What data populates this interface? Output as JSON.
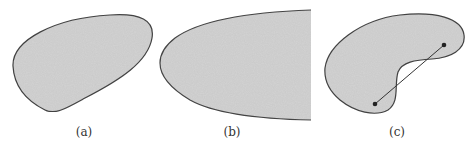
{
  "figure": {
    "fill_color": "#d3d3d3",
    "stroke_color": "#444444",
    "panels": [
      {
        "id": "a",
        "label": "(a)",
        "shape": "convex-blob"
      },
      {
        "id": "b",
        "label": "(b)",
        "shape": "unbounded-parabolic-region"
      },
      {
        "id": "c",
        "label": "(c)",
        "shape": "nonconvex-kidney",
        "segment_endpoints": 2
      }
    ]
  }
}
